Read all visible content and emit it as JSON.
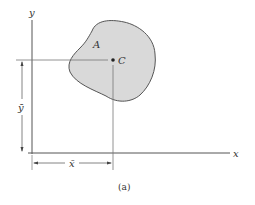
{
  "figure": {
    "axis_x_label": "x",
    "axis_y_label": "y",
    "area_label": "A",
    "centroid_label": "C",
    "xbar_label": "x̄",
    "ybar_label": "ȳ",
    "caption": "(a)"
  },
  "colors": {
    "area_fill": "#d9d9d9",
    "lines": "#555555"
  }
}
